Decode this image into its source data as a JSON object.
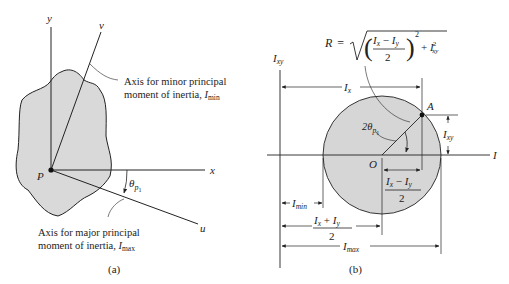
{
  "panel_a": {
    "caption": "(a)",
    "axes": {
      "y": "y",
      "x": "x",
      "v": "v",
      "u": "u"
    },
    "point": "P",
    "angle": {
      "symbol": "θ",
      "sub": "p",
      "subsub": "1"
    },
    "minor_axis_note": {
      "line1": "Axis for minor principal",
      "line2": "moment of inertia, ",
      "I": "I",
      "sub": "min"
    },
    "major_axis_note": {
      "line1": "Axis for major principal",
      "line2": "moment of inertia, ",
      "I": "I",
      "sub": "max"
    },
    "colors": {
      "shape_fill": "#d9d9d9",
      "stroke": "#222222"
    }
  },
  "panel_b": {
    "caption": "(b)",
    "vertical_axis": {
      "I": "I",
      "sub": "xy"
    },
    "horizontal_axis": "I",
    "center": "O",
    "point_A": "A",
    "radius_formula": {
      "lhs": "R =",
      "num_a": "I",
      "num_a_sub": "x",
      "minus": " − ",
      "num_b": "I",
      "num_b_sub": "y",
      "den": "2",
      "sq": "2",
      "plus": "+ ",
      "term": "I",
      "term_sub": "xy",
      "term_sup": "2"
    },
    "angle_label": {
      "prefix": "2θ",
      "sub": "p",
      "subsub": "1"
    },
    "dims": {
      "Ix": {
        "I": "I",
        "sub": "x"
      },
      "Ixy": {
        "I": "I",
        "sub": "xy"
      },
      "half_diff": {
        "a": "I",
        "a_sub": "x",
        "op": " − ",
        "b": "I",
        "b_sub": "y",
        "den": "2"
      },
      "half_sum": {
        "a": "I",
        "a_sub": "x",
        "op": " + ",
        "b": "I",
        "b_sub": "y",
        "den": "2"
      },
      "Imin": {
        "I": "I",
        "sub": "min"
      },
      "Imax": {
        "I": "I",
        "sub": "max"
      }
    },
    "colors": {
      "circle_fill": "#d6d6d6",
      "stroke": "#222222"
    }
  }
}
